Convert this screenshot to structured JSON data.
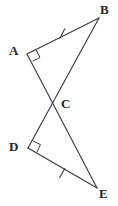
{
  "figure": {
    "kind": "geometry-diagram",
    "background_color": "#ffffff",
    "stroke_color": "#3b3b44",
    "label_color": "#27272e"
  },
  "vertices": [
    {
      "id": "A",
      "label": "A",
      "x": 27,
      "y": 54,
      "label_x": 9,
      "label_y": 44
    },
    {
      "id": "B",
      "label": "B",
      "x": 99,
      "y": 18,
      "label_x": 100,
      "label_y": 3
    },
    {
      "id": "C",
      "label": "C",
      "x": 55,
      "y": 103,
      "label_x": 61,
      "label_y": 97
    },
    {
      "id": "D",
      "label": "D",
      "x": 28,
      "y": 148,
      "label_x": 9,
      "label_y": 140
    },
    {
      "id": "E",
      "label": "E",
      "x": 97,
      "y": 188,
      "label_x": 99,
      "label_y": 187
    }
  ],
  "segments": [
    {
      "id": "AB",
      "from": "A",
      "to": "B",
      "ticks": 1
    },
    {
      "id": "AE",
      "from": "A",
      "to": "E",
      "ticks": 0
    },
    {
      "id": "BD",
      "from": "B",
      "to": "D",
      "ticks": 0
    },
    {
      "id": "DE",
      "from": "D",
      "to": "E",
      "ticks": 1
    }
  ],
  "tick_marks": [
    {
      "id": "tick-ab",
      "on_segment": "AB",
      "x": 62,
      "y": 33,
      "count": 1
    },
    {
      "id": "tick-de",
      "on_segment": "DE",
      "x": 62,
      "y": 173,
      "count": 1
    }
  ],
  "right_angles": [
    {
      "id": "right-angle-a",
      "at_vertex": "A",
      "size": 9
    },
    {
      "id": "right-angle-d",
      "at_vertex": "D",
      "size": 9
    }
  ],
  "triangles": [
    {
      "id": "ABC",
      "vertices": [
        "A",
        "B",
        "C"
      ]
    },
    {
      "id": "DEC",
      "vertices": [
        "D",
        "E",
        "C"
      ]
    }
  ]
}
